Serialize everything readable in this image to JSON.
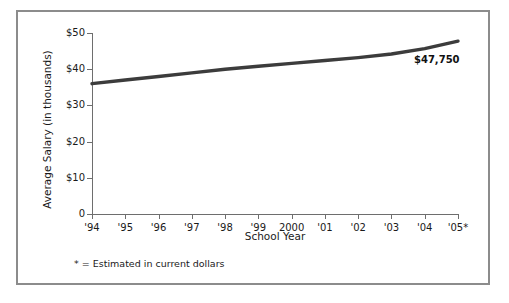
{
  "chart_data": {
    "type": "line",
    "title": "",
    "xlabel": "School Year",
    "ylabel": "Average Salary (in thousands)",
    "categories": [
      "'94",
      "'95",
      "'96",
      "'97",
      "'98",
      "'99",
      "2000",
      "'01",
      "'02",
      "'03",
      "'04",
      "'05*"
    ],
    "values": [
      36.0,
      37.0,
      38.0,
      39.0,
      40.0,
      40.8,
      41.6,
      42.4,
      43.2,
      44.2,
      45.7,
      47.75
    ],
    "ylim": [
      0,
      50
    ],
    "ytick_labels": [
      "$50",
      "$40",
      "$30",
      "$20",
      "$10",
      "0"
    ],
    "ytick_values": [
      50,
      40,
      30,
      20,
      10,
      0
    ],
    "grid": false,
    "legend": "none",
    "series_color": "#3c3c3c",
    "axis_color": "#6e6e6e",
    "border_color": "#8c8c8c",
    "annotations": [
      {
        "name": "end-value-label",
        "text": "$47,750",
        "x_category": "'05*",
        "y_value": 47.75
      }
    ],
    "footnote": "* = Estimated in current dollars"
  }
}
